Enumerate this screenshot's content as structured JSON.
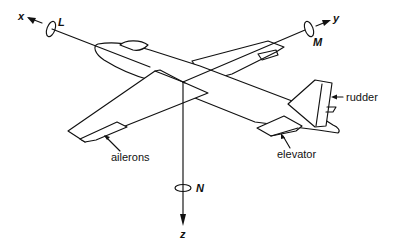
{
  "diagram": {
    "title": "",
    "axes": [
      {
        "id": "x",
        "label": "x",
        "moment_label": "L"
      },
      {
        "id": "y",
        "label": "y",
        "moment_label": "M"
      },
      {
        "id": "z",
        "label": "z",
        "moment_label": "N"
      }
    ],
    "control_surfaces": [
      {
        "id": "ailerons",
        "label": "ailerons"
      },
      {
        "id": "elevator",
        "label": "elevator"
      },
      {
        "id": "rudder",
        "label": "rudder"
      }
    ],
    "colors": {
      "line": "#111111",
      "background": "#ffffff"
    }
  }
}
